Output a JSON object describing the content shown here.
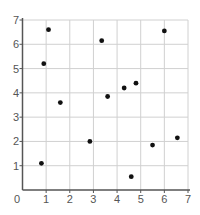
{
  "chart_data": {
    "type": "scatter",
    "title": "",
    "xlabel": "",
    "ylabel": "",
    "xlim": [
      0,
      7
    ],
    "ylim": [
      0,
      7
    ],
    "grid": true,
    "legend": null,
    "x_ticks": [
      "0",
      "1",
      "2",
      "3",
      "4",
      "5",
      "6",
      "7"
    ],
    "y_ticks": [
      "1",
      "2",
      "3",
      "4",
      "5",
      "6",
      "7"
    ],
    "points": [
      {
        "x": 1.1,
        "y": 6.6
      },
      {
        "x": 0.9,
        "y": 5.2
      },
      {
        "x": 1.6,
        "y": 3.6
      },
      {
        "x": 0.8,
        "y": 1.1
      },
      {
        "x": 2.85,
        "y": 2.0
      },
      {
        "x": 3.35,
        "y": 6.15
      },
      {
        "x": 3.6,
        "y": 3.85
      },
      {
        "x": 4.3,
        "y": 4.2
      },
      {
        "x": 4.8,
        "y": 4.4
      },
      {
        "x": 4.6,
        "y": 0.55
      },
      {
        "x": 5.5,
        "y": 1.85
      },
      {
        "x": 6.0,
        "y": 6.55
      },
      {
        "x": 6.55,
        "y": 2.15
      }
    ],
    "colors": {
      "marker": "#111111",
      "axis": "#555555",
      "grid": "#d0d0d0",
      "tick_label": "#555555"
    }
  }
}
